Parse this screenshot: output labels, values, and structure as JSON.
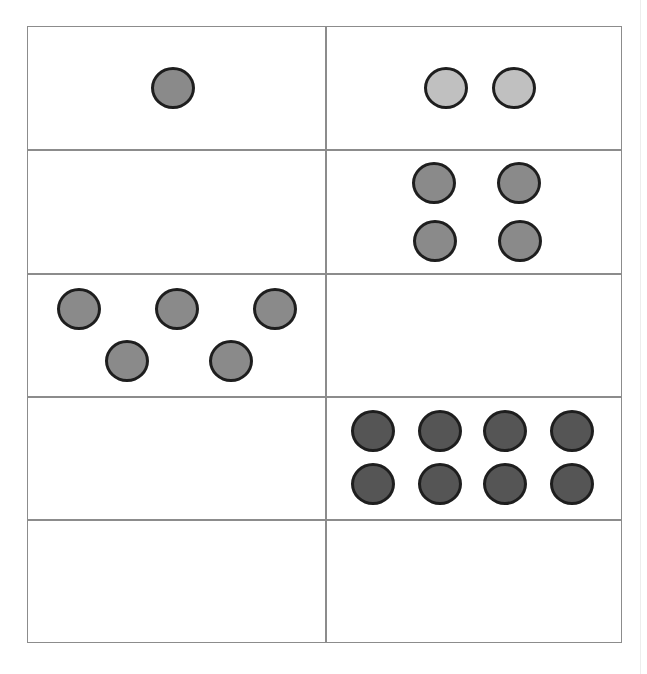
{
  "header": {
    "partial_text": "... page ... ... p ..."
  },
  "colors": {
    "grid_line": "#8c8c8c",
    "dot_outline": "#1e1e1e",
    "dot_medium": "#8a8a8a",
    "dot_light": "#c0c0c0",
    "dot_dark": "#555555"
  },
  "grid": {
    "rows": 5,
    "cols": 2,
    "cells": [
      {
        "row": 0,
        "col": 0,
        "count": 1,
        "shade": "medium"
      },
      {
        "row": 0,
        "col": 1,
        "count": 2,
        "shade": "light"
      },
      {
        "row": 1,
        "col": 0,
        "count": 0,
        "shade": null
      },
      {
        "row": 1,
        "col": 1,
        "count": 4,
        "shade": "medium"
      },
      {
        "row": 2,
        "col": 0,
        "count": 5,
        "shade": "medium"
      },
      {
        "row": 2,
        "col": 1,
        "count": 0,
        "shade": null
      },
      {
        "row": 3,
        "col": 0,
        "count": 0,
        "shade": null
      },
      {
        "row": 3,
        "col": 1,
        "count": 8,
        "shade": "dark"
      },
      {
        "row": 4,
        "col": 0,
        "count": 0,
        "shade": null
      },
      {
        "row": 4,
        "col": 1,
        "count": 0,
        "shade": null
      }
    ]
  }
}
